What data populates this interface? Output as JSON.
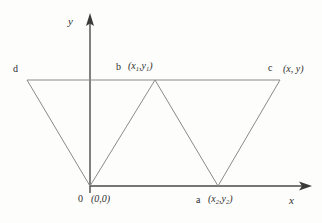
{
  "figure": {
    "background_color": "#fdfdfc",
    "line_color": "#6b6b6b",
    "axis_color": "#4a4a4a",
    "text_color": "#2e2e2e",
    "axes": {
      "x_label": "x",
      "y_label": "y",
      "origin_label": "0",
      "origin_coord": "(0,0)"
    },
    "points": [
      {
        "id": "d",
        "label": "d",
        "coord": null,
        "x": 27,
        "y": 80
      },
      {
        "id": "b",
        "label": "b",
        "coord": "(x1,y1)",
        "x": 155,
        "y": 80
      },
      {
        "id": "c",
        "label": "c",
        "coord": "(x,y)",
        "x": 280,
        "y": 80
      },
      {
        "id": "o",
        "label": "0",
        "coord": "(0,0)",
        "x": 90,
        "y": 186
      },
      {
        "id": "a",
        "label": "a",
        "coord": "(x2,y2)",
        "x": 218,
        "y": 186
      }
    ],
    "label_d": "d",
    "label_b": "b",
    "label_c": "c",
    "label_a": "a",
    "label_o": "0",
    "coord_b_open": "(",
    "coord_b_x": "x",
    "coord_b_xsub": "1",
    "coord_b_comma": ",",
    "coord_b_y": "y",
    "coord_b_ysub": "1",
    "coord_b_close": ")",
    "coord_a_open": "(",
    "coord_a_x": "x",
    "coord_a_xsub": "2",
    "coord_a_comma": ",",
    "coord_a_y": "y",
    "coord_a_ysub": "2",
    "coord_a_close": ")",
    "coord_c": "(x, y)",
    "coord_o": "(0,0)"
  }
}
